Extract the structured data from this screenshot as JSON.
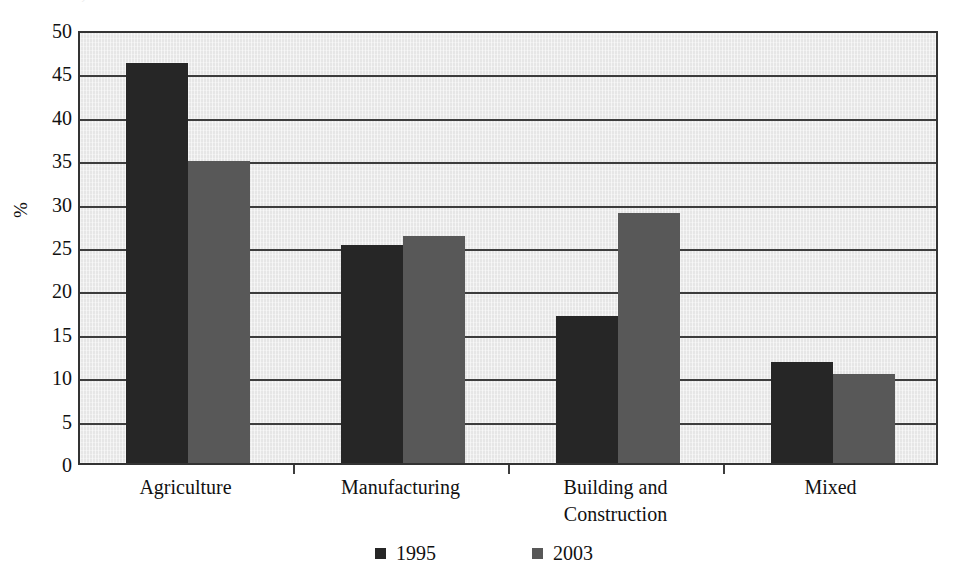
{
  "chart_data": {
    "type": "bar",
    "title": "...Sudan, 1995 and 2003",
    "subtitle": "",
    "xlabel": "",
    "ylabel": "%",
    "ylim": [
      0,
      50
    ],
    "ytick_step": 5,
    "yticks": [
      50,
      45,
      40,
      35,
      30,
      25,
      20,
      15,
      10,
      5,
      0
    ],
    "grid": true,
    "legend_position": "bottom",
    "categories": [
      "Agriculture",
      "Manufacturing",
      "Building and Construction",
      "Mixed"
    ],
    "category_lines": [
      [
        "Agriculture"
      ],
      [
        "Manufacturing"
      ],
      [
        "Building and",
        "Construction"
      ],
      [
        "Mixed"
      ]
    ],
    "series": [
      {
        "name": "1995",
        "color": "#262626",
        "values": [
          46.1,
          25.1,
          16.9,
          11.6
        ]
      },
      {
        "name": "2003",
        "color": "#585858",
        "values": [
          34.8,
          26.1,
          28.8,
          10.3
        ]
      }
    ]
  },
  "style": {
    "plot_background": "#e6e6e6",
    "axis_color": "#333333",
    "gridline_color": "#3d3d3d",
    "text_color": "#111111",
    "page_background": "#ffffff"
  }
}
